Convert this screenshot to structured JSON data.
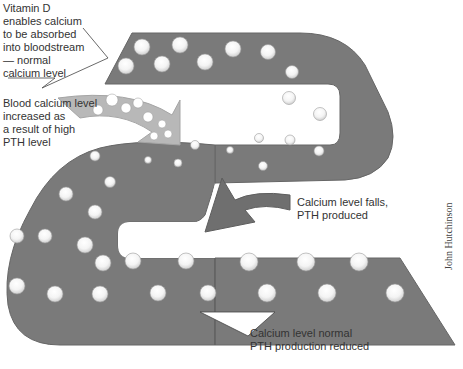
{
  "diagram": {
    "colors": {
      "band": "#7a7a7a",
      "band_edge": "#6a6a6a",
      "arrow_light": "#b8b8b8",
      "ball": "#ffffff",
      "ball_shadow": "#a9a9a9",
      "text": "#333333"
    },
    "labels": {
      "vitamin_d": "Vitamin D\nenables calcium\nto be absorbed\ninto bloodstream\n— normal\ncalcium level",
      "blood_calcium": "Blood calcium level\nincreased as\na result of high\nPTH level",
      "level_falls": "Calcium level falls,\nPTH produced",
      "level_normal": "Calcium level normal\nPTH production reduced"
    },
    "credit": "John Hutchinson"
  }
}
